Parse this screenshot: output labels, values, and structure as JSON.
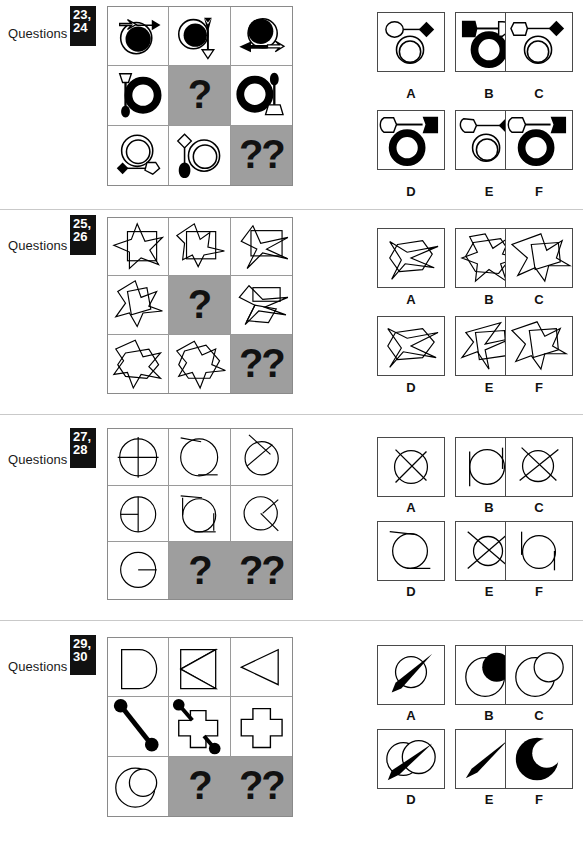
{
  "page": {
    "label_text": "Questions",
    "shaded_color": "#9e9e9e",
    "separator_color": "#c9c9c9",
    "single_question_mark": "?",
    "double_question_mark": "??"
  },
  "option_letters": [
    "A",
    "B",
    "C",
    "D",
    "E",
    "F"
  ],
  "sections": [
    {
      "id": "q23-24",
      "numbers": [
        "23,",
        "24"
      ],
      "label": "Questions",
      "matrix": {
        "rows": 3,
        "cols": 3,
        "cells": [
          {
            "r": 1,
            "c": 1,
            "type": "figure",
            "desc": "white arrow pointing right with black filled circle over white circle"
          },
          {
            "r": 1,
            "c": 2,
            "type": "figure",
            "desc": "black circle on white circle with black arrow down and white triangle"
          },
          {
            "r": 1,
            "c": 3,
            "type": "figure",
            "desc": "black circle over white circle with black arrow pointing left"
          },
          {
            "r": 2,
            "c": 1,
            "type": "figure",
            "desc": "black ring with white pentagon top and black pentagon bottom on stem"
          },
          {
            "r": 2,
            "c": 2,
            "type": "question",
            "mark": "?"
          },
          {
            "r": 2,
            "c": 3,
            "type": "figure",
            "desc": "black ring with black pentagon top and white pentagon bottom on stem"
          },
          {
            "r": 3,
            "c": 1,
            "type": "figure",
            "desc": "two white circles with black diamond and white pentagon"
          },
          {
            "r": 3,
            "c": 2,
            "type": "figure",
            "desc": "white diamond and black pentagon with two white circles"
          },
          {
            "r": 3,
            "c": 3,
            "type": "question",
            "mark": "??"
          }
        ]
      },
      "options": [
        {
          "letter": "A",
          "desc": "white circle, black diamond, two white circles"
        },
        {
          "letter": "B",
          "desc": "black pentagon left, white pentagon right, black ring"
        },
        {
          "letter": "C",
          "desc": "white pentagon, black diamond, two white circles"
        },
        {
          "letter": "D",
          "desc": "white pentagon left, black pentagon right, black ring"
        },
        {
          "letter": "E",
          "desc": "white pentagon, black diamond, two white circles"
        },
        {
          "letter": "F",
          "desc": "white pentagon left, black pentagon right, black ring"
        }
      ]
    },
    {
      "id": "q25-26",
      "numbers": [
        "25,",
        "26"
      ],
      "label": "Questions",
      "matrix": {
        "rows": 3,
        "cols": 3,
        "cells": [
          {
            "r": 1,
            "c": 1,
            "type": "figure",
            "desc": "five point star overlaid with square outline"
          },
          {
            "r": 1,
            "c": 2,
            "type": "figure",
            "desc": "distorted star with square outline"
          },
          {
            "r": 1,
            "c": 3,
            "type": "figure",
            "desc": "collapsed star with square outline"
          },
          {
            "r": 2,
            "c": 1,
            "type": "figure",
            "desc": "star outline shape"
          },
          {
            "r": 2,
            "c": 2,
            "type": "question",
            "mark": "?"
          },
          {
            "r": 2,
            "c": 3,
            "type": "figure",
            "desc": "flattened star with quadrilateral"
          },
          {
            "r": 3,
            "c": 1,
            "type": "figure",
            "desc": "star with hexagon overlay"
          },
          {
            "r": 3,
            "c": 2,
            "type": "figure",
            "desc": "star with hexagon overlay rotated"
          },
          {
            "r": 3,
            "c": 3,
            "type": "question",
            "mark": "??"
          }
        ]
      },
      "options": [
        {
          "letter": "A",
          "desc": "hexagon with star overlay"
        },
        {
          "letter": "B",
          "desc": "seven point star with hexagon"
        },
        {
          "letter": "C",
          "desc": "jagged star with square"
        },
        {
          "letter": "D",
          "desc": "hexagon with star overlay"
        },
        {
          "letter": "E",
          "desc": "quadrilateral with star spikes"
        },
        {
          "letter": "F",
          "desc": "star with quadrilateral overlay"
        }
      ]
    },
    {
      "id": "q27-28",
      "numbers": [
        "27,",
        "28"
      ],
      "label": "Questions",
      "matrix": {
        "rows": 3,
        "cols": 3,
        "cells": [
          {
            "r": 1,
            "c": 1,
            "type": "figure",
            "desc": "circle with vertical and horizontal cross lines"
          },
          {
            "r": 1,
            "c": 2,
            "type": "figure",
            "desc": "circle with tangent lines top-left and bottom-right"
          },
          {
            "r": 1,
            "c": 3,
            "type": "figure",
            "desc": "circle with diagonal cross lines"
          },
          {
            "r": 2,
            "c": 1,
            "type": "figure",
            "desc": "circle with half cross lines"
          },
          {
            "r": 2,
            "c": 2,
            "type": "figure",
            "desc": "circle with short tangent lines"
          },
          {
            "r": 2,
            "c": 3,
            "type": "figure",
            "desc": "circle with short diagonal lines"
          },
          {
            "r": 3,
            "c": 1,
            "type": "figure",
            "desc": "circle with single horizontal radius line"
          },
          {
            "r": 3,
            "c": 2,
            "type": "question",
            "mark": "?"
          },
          {
            "r": 3,
            "c": 3,
            "type": "question",
            "mark": "??"
          }
        ]
      },
      "options": [
        {
          "letter": "A",
          "desc": "circle with full diagonal cross"
        },
        {
          "letter": "B",
          "desc": "circle with vertical tangent line right"
        },
        {
          "letter": "C",
          "desc": "circle with long diagonal cross"
        },
        {
          "letter": "D",
          "desc": "circle with tangent lines top and bottom"
        },
        {
          "letter": "E",
          "desc": "circle with extended diagonal cross"
        },
        {
          "letter": "F",
          "desc": "circle with vertical tangent line left"
        }
      ]
    },
    {
      "id": "q29-30",
      "numbers": [
        "29,",
        "30"
      ],
      "label": "Questions",
      "matrix": {
        "rows": 3,
        "cols": 3,
        "cells": [
          {
            "r": 1,
            "c": 1,
            "type": "figure",
            "desc": "D shape half circle with square"
          },
          {
            "r": 1,
            "c": 2,
            "type": "figure",
            "desc": "bow-tie triangles in square"
          },
          {
            "r": 1,
            "c": 3,
            "type": "figure",
            "desc": "left pointing triangle"
          },
          {
            "r": 2,
            "c": 1,
            "type": "figure",
            "desc": "thick diagonal bar with round ends"
          },
          {
            "r": 2,
            "c": 2,
            "type": "figure",
            "desc": "cross shape with two round-ended bars"
          },
          {
            "r": 2,
            "c": 3,
            "type": "figure",
            "desc": "plain cross shape"
          },
          {
            "r": 3,
            "c": 1,
            "type": "figure",
            "desc": "two overlapping circles"
          },
          {
            "r": 3,
            "c": 2,
            "type": "question",
            "mark": "?"
          },
          {
            "r": 3,
            "c": 3,
            "type": "question",
            "mark": "??"
          }
        ]
      },
      "options": [
        {
          "letter": "A",
          "desc": "circle with black tapered needle"
        },
        {
          "letter": "B",
          "desc": "circle with black filled circle overlap"
        },
        {
          "letter": "C",
          "desc": "two overlapping outline circles"
        },
        {
          "letter": "D",
          "desc": "two circles with black tapered needle"
        },
        {
          "letter": "E",
          "desc": "black tapered needle only"
        },
        {
          "letter": "F",
          "desc": "black crescent circle"
        }
      ]
    }
  ]
}
